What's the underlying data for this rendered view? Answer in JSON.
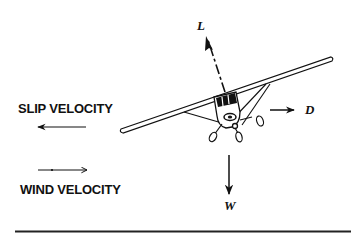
{
  "diagram": {
    "type": "forces-on-aircraft-in-forward-slip",
    "labels": {
      "slip_velocity": "SLIP VELOCITY",
      "wind_velocity": "WIND VELOCITY",
      "lift": "L",
      "drag": "D",
      "weight": "W"
    },
    "arrows": [
      {
        "name": "slip-velocity-arrow",
        "direction": "left"
      },
      {
        "name": "wind-velocity-arrow",
        "direction": "right"
      },
      {
        "name": "lift-arrow",
        "direction": "up-left (perpendicular to wing)"
      },
      {
        "name": "drag-arrow",
        "direction": "right"
      },
      {
        "name": "weight-arrow",
        "direction": "down"
      }
    ],
    "colors": {
      "ink": "#111111",
      "background": "#ffffff"
    }
  }
}
